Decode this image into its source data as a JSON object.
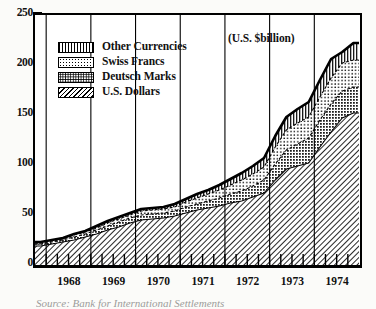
{
  "figure": {
    "units_note": "(U.S. $billion)",
    "source_caption": "Source: Bank for International Settlements"
  },
  "legend": {
    "position": "top-left-inside",
    "items": [
      {
        "label": "Other Currencies",
        "pattern": "vertical-stripes",
        "swatch_class": "sw-vert",
        "fill": "#ffffff"
      },
      {
        "label": "Swiss Francs",
        "pattern": "light-stipple",
        "swatch_class": "sw-dot-light",
        "fill": "#ffffff"
      },
      {
        "label": "Deutsch Marks",
        "pattern": "dense-stipple",
        "swatch_class": "sw-dot-dense",
        "fill": "#ffffff"
      },
      {
        "label": "U.S. Dollars",
        "pattern": "diagonal-hatch",
        "swatch_class": "sw-hatch",
        "fill": "#ffffff"
      }
    ]
  },
  "axes": {
    "y": {
      "major_ticks": [
        0,
        50,
        100,
        150,
        200,
        250
      ],
      "minor_ticks": [
        25,
        75,
        125,
        175,
        225
      ],
      "range": [
        0,
        250
      ],
      "label": ""
    },
    "x": {
      "tick_labels": [
        "1968",
        "1969",
        "1970",
        "1971",
        "1972",
        "1973",
        "1974"
      ],
      "minor_tick_interval": "quarterly",
      "range": [
        "1967.75",
        "1975.0"
      ],
      "label": ""
    }
  },
  "colors": {
    "ink": "#000000",
    "paper": "#ffffff",
    "page": "#fbfbf9"
  },
  "chart_data": {
    "type": "area",
    "title": "",
    "subtitle": "",
    "xlabel": "",
    "ylabel": "",
    "annotations": [
      "(U.S. $billion)"
    ],
    "units": "U.S. $billion",
    "stacked": true,
    "grid": false,
    "legend_position": "upper-left",
    "xlim": [
      1967.75,
      1975.0
    ],
    "ylim": [
      0,
      250
    ],
    "x_tick_labels": [
      "1968",
      "1969",
      "1970",
      "1971",
      "1972",
      "1973",
      "1974"
    ],
    "y_ticks": [
      0,
      50,
      100,
      150,
      200,
      250
    ],
    "x": [
      1967.875,
      1968.125,
      1968.375,
      1968.625,
      1968.875,
      1969.125,
      1969.375,
      1969.625,
      1969.875,
      1970.125,
      1970.375,
      1970.625,
      1970.875,
      1971.125,
      1971.375,
      1971.625,
      1971.875,
      1972.125,
      1972.375,
      1972.625,
      1972.875,
      1973.125,
      1973.375,
      1973.625,
      1973.875,
      1974.125,
      1974.375,
      1974.625,
      1974.875
    ],
    "series": [
      {
        "name": "U.S. Dollars",
        "pattern": "diagonal-hatch",
        "values": [
          19,
          21,
          23,
          25,
          28,
          31,
          35,
          38,
          42,
          45,
          46,
          47,
          49,
          52,
          55,
          57,
          59,
          62,
          64,
          68,
          72,
          85,
          96,
          99,
          102,
          118,
          133,
          147,
          152
        ]
      },
      {
        "name": "Deutsch Marks",
        "pattern": "dense-stipple",
        "values": [
          2,
          2,
          2,
          3,
          3,
          4,
          4,
          5,
          5,
          5,
          5,
          5,
          5,
          6,
          6,
          7,
          8,
          9,
          10,
          11,
          13,
          16,
          19,
          22,
          25,
          27,
          28,
          27,
          26
        ]
      },
      {
        "name": "Swiss Francs",
        "pattern": "light-stipple",
        "values": [
          1,
          1,
          1,
          2,
          2,
          2,
          3,
          3,
          3,
          4,
          4,
          4,
          4,
          5,
          6,
          7,
          8,
          9,
          11,
          12,
          13,
          17,
          20,
          21,
          21,
          23,
          26,
          28,
          27
        ]
      },
      {
        "name": "Other Currencies",
        "pattern": "vertical-stripes",
        "values": [
          1,
          1,
          1,
          1,
          1,
          2,
          2,
          2,
          2,
          2,
          2,
          2,
          3,
          3,
          4,
          4,
          5,
          6,
          7,
          8,
          9,
          11,
          13,
          14,
          15,
          17,
          19,
          11,
          17
        ]
      }
    ],
    "totals": [
      23,
      25,
      27,
      31,
      34,
      39,
      44,
      48,
      52,
      56,
      57,
      58,
      61,
      66,
      71,
      75,
      80,
      86,
      92,
      99,
      107,
      129,
      148,
      156,
      163,
      185,
      206,
      213,
      222
    ]
  }
}
